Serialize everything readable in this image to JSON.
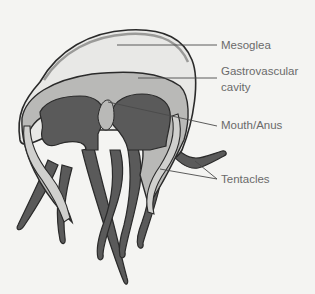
{
  "diagram": {
    "labels": [
      {
        "id": "mesoglea",
        "text": "Mesoglea"
      },
      {
        "id": "gastrovascular",
        "line1": "Gastrovascular",
        "line2": "cavity"
      },
      {
        "id": "mouth",
        "text": "Mouth/Anus"
      },
      {
        "id": "tentacles",
        "text": "Tentacles"
      }
    ]
  },
  "colors": {
    "background": "#f4f4f2",
    "outline": "#2a2a2a",
    "mesoglea_fill": "#e8e8e6",
    "cavity_fill": "#b9b9b7",
    "tissue_fill": "#5a5a5a",
    "leader_line": "#4a4a4a",
    "label_text": "#6a6a6a"
  }
}
